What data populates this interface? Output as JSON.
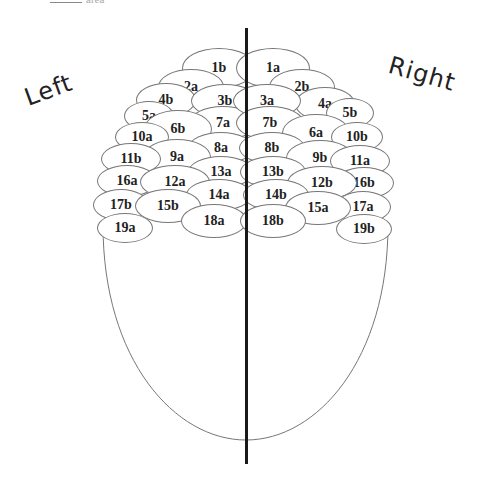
{
  "top_fragment": {
    "text": "area"
  },
  "labels": {
    "left": "Left",
    "right": "Right"
  },
  "colors": {
    "outline": "#777777",
    "midline": "#1a1a1a",
    "text": "#222222",
    "background": "#ffffff"
  },
  "head_outline": {
    "left_x": 103,
    "right_x": 388,
    "top_y": 225,
    "bottom_y": 440
  },
  "midline": {
    "x": 246,
    "top_y": 28,
    "bottom_y": 464
  },
  "regions_left": [
    {
      "label": "1b",
      "cx": 219,
      "cy": 68,
      "rx": 37,
      "ry": 20
    },
    {
      "label": "2a",
      "cx": 191,
      "cy": 87,
      "rx": 33,
      "ry": 18
    },
    {
      "label": "4b",
      "cx": 166,
      "cy": 100,
      "rx": 30,
      "ry": 17
    },
    {
      "label": "3b",
      "cx": 225,
      "cy": 101,
      "rx": 34,
      "ry": 17
    },
    {
      "label": "5a",
      "cx": 149,
      "cy": 116,
      "rx": 25,
      "ry": 15
    },
    {
      "label": "7a",
      "cx": 223,
      "cy": 123,
      "rx": 34,
      "ry": 17
    },
    {
      "label": "6b",
      "cx": 178,
      "cy": 129,
      "rx": 34,
      "ry": 19
    },
    {
      "label": "10a",
      "cx": 142,
      "cy": 137,
      "rx": 27,
      "ry": 15
    },
    {
      "label": "8a",
      "cx": 221,
      "cy": 148,
      "rx": 33,
      "ry": 16
    },
    {
      "label": "9a",
      "cx": 177,
      "cy": 157,
      "rx": 34,
      "ry": 18
    },
    {
      "label": "11b",
      "cx": 131,
      "cy": 159,
      "rx": 30,
      "ry": 16
    },
    {
      "label": "13a",
      "cx": 221,
      "cy": 172,
      "rx": 33,
      "ry": 16
    },
    {
      "label": "16a",
      "cx": 127,
      "cy": 181,
      "rx": 30,
      "ry": 16
    },
    {
      "label": "12a",
      "cx": 175,
      "cy": 182,
      "rx": 35,
      "ry": 17
    },
    {
      "label": "14a",
      "cx": 219,
      "cy": 195,
      "rx": 33,
      "ry": 16
    },
    {
      "label": "17b",
      "cx": 121,
      "cy": 205,
      "rx": 28,
      "ry": 16
    },
    {
      "label": "15b",
      "cx": 168,
      "cy": 206,
      "rx": 33,
      "ry": 17
    },
    {
      "label": "18a",
      "cx": 214,
      "cy": 221,
      "rx": 33,
      "ry": 17
    },
    {
      "label": "19a",
      "cx": 125,
      "cy": 228,
      "rx": 28,
      "ry": 15
    }
  ],
  "regions_right": [
    {
      "label": "1a",
      "cx": 273,
      "cy": 68,
      "rx": 37,
      "ry": 20
    },
    {
      "label": "2b",
      "cx": 302,
      "cy": 87,
      "rx": 33,
      "ry": 18
    },
    {
      "label": "4a",
      "cx": 325,
      "cy": 104,
      "rx": 30,
      "ry": 17
    },
    {
      "label": "3a",
      "cx": 267,
      "cy": 101,
      "rx": 34,
      "ry": 17
    },
    {
      "label": "5b",
      "cx": 350,
      "cy": 113,
      "rx": 24,
      "ry": 15
    },
    {
      "label": "7b",
      "cx": 270,
      "cy": 123,
      "rx": 34,
      "ry": 17
    },
    {
      "label": "6a",
      "cx": 316,
      "cy": 133,
      "rx": 34,
      "ry": 19
    },
    {
      "label": "10b",
      "cx": 357,
      "cy": 137,
      "rx": 26,
      "ry": 15
    },
    {
      "label": "8b",
      "cx": 272,
      "cy": 148,
      "rx": 33,
      "ry": 16
    },
    {
      "label": "9b",
      "cx": 320,
      "cy": 158,
      "rx": 34,
      "ry": 18
    },
    {
      "label": "11a",
      "cx": 360,
      "cy": 161,
      "rx": 30,
      "ry": 16
    },
    {
      "label": "13b",
      "cx": 273,
      "cy": 172,
      "rx": 33,
      "ry": 16
    },
    {
      "label": "16b",
      "cx": 364,
      "cy": 183,
      "rx": 30,
      "ry": 16
    },
    {
      "label": "12b",
      "cx": 322,
      "cy": 183,
      "rx": 35,
      "ry": 17
    },
    {
      "label": "14b",
      "cx": 276,
      "cy": 195,
      "rx": 33,
      "ry": 16
    },
    {
      "label": "17a",
      "cx": 363,
      "cy": 207,
      "rx": 28,
      "ry": 16
    },
    {
      "label": "15a",
      "cx": 318,
      "cy": 208,
      "rx": 33,
      "ry": 17
    },
    {
      "label": "18b",
      "cx": 273,
      "cy": 221,
      "rx": 33,
      "ry": 17
    },
    {
      "label": "19b",
      "cx": 364,
      "cy": 229,
      "rx": 28,
      "ry": 15
    }
  ]
}
